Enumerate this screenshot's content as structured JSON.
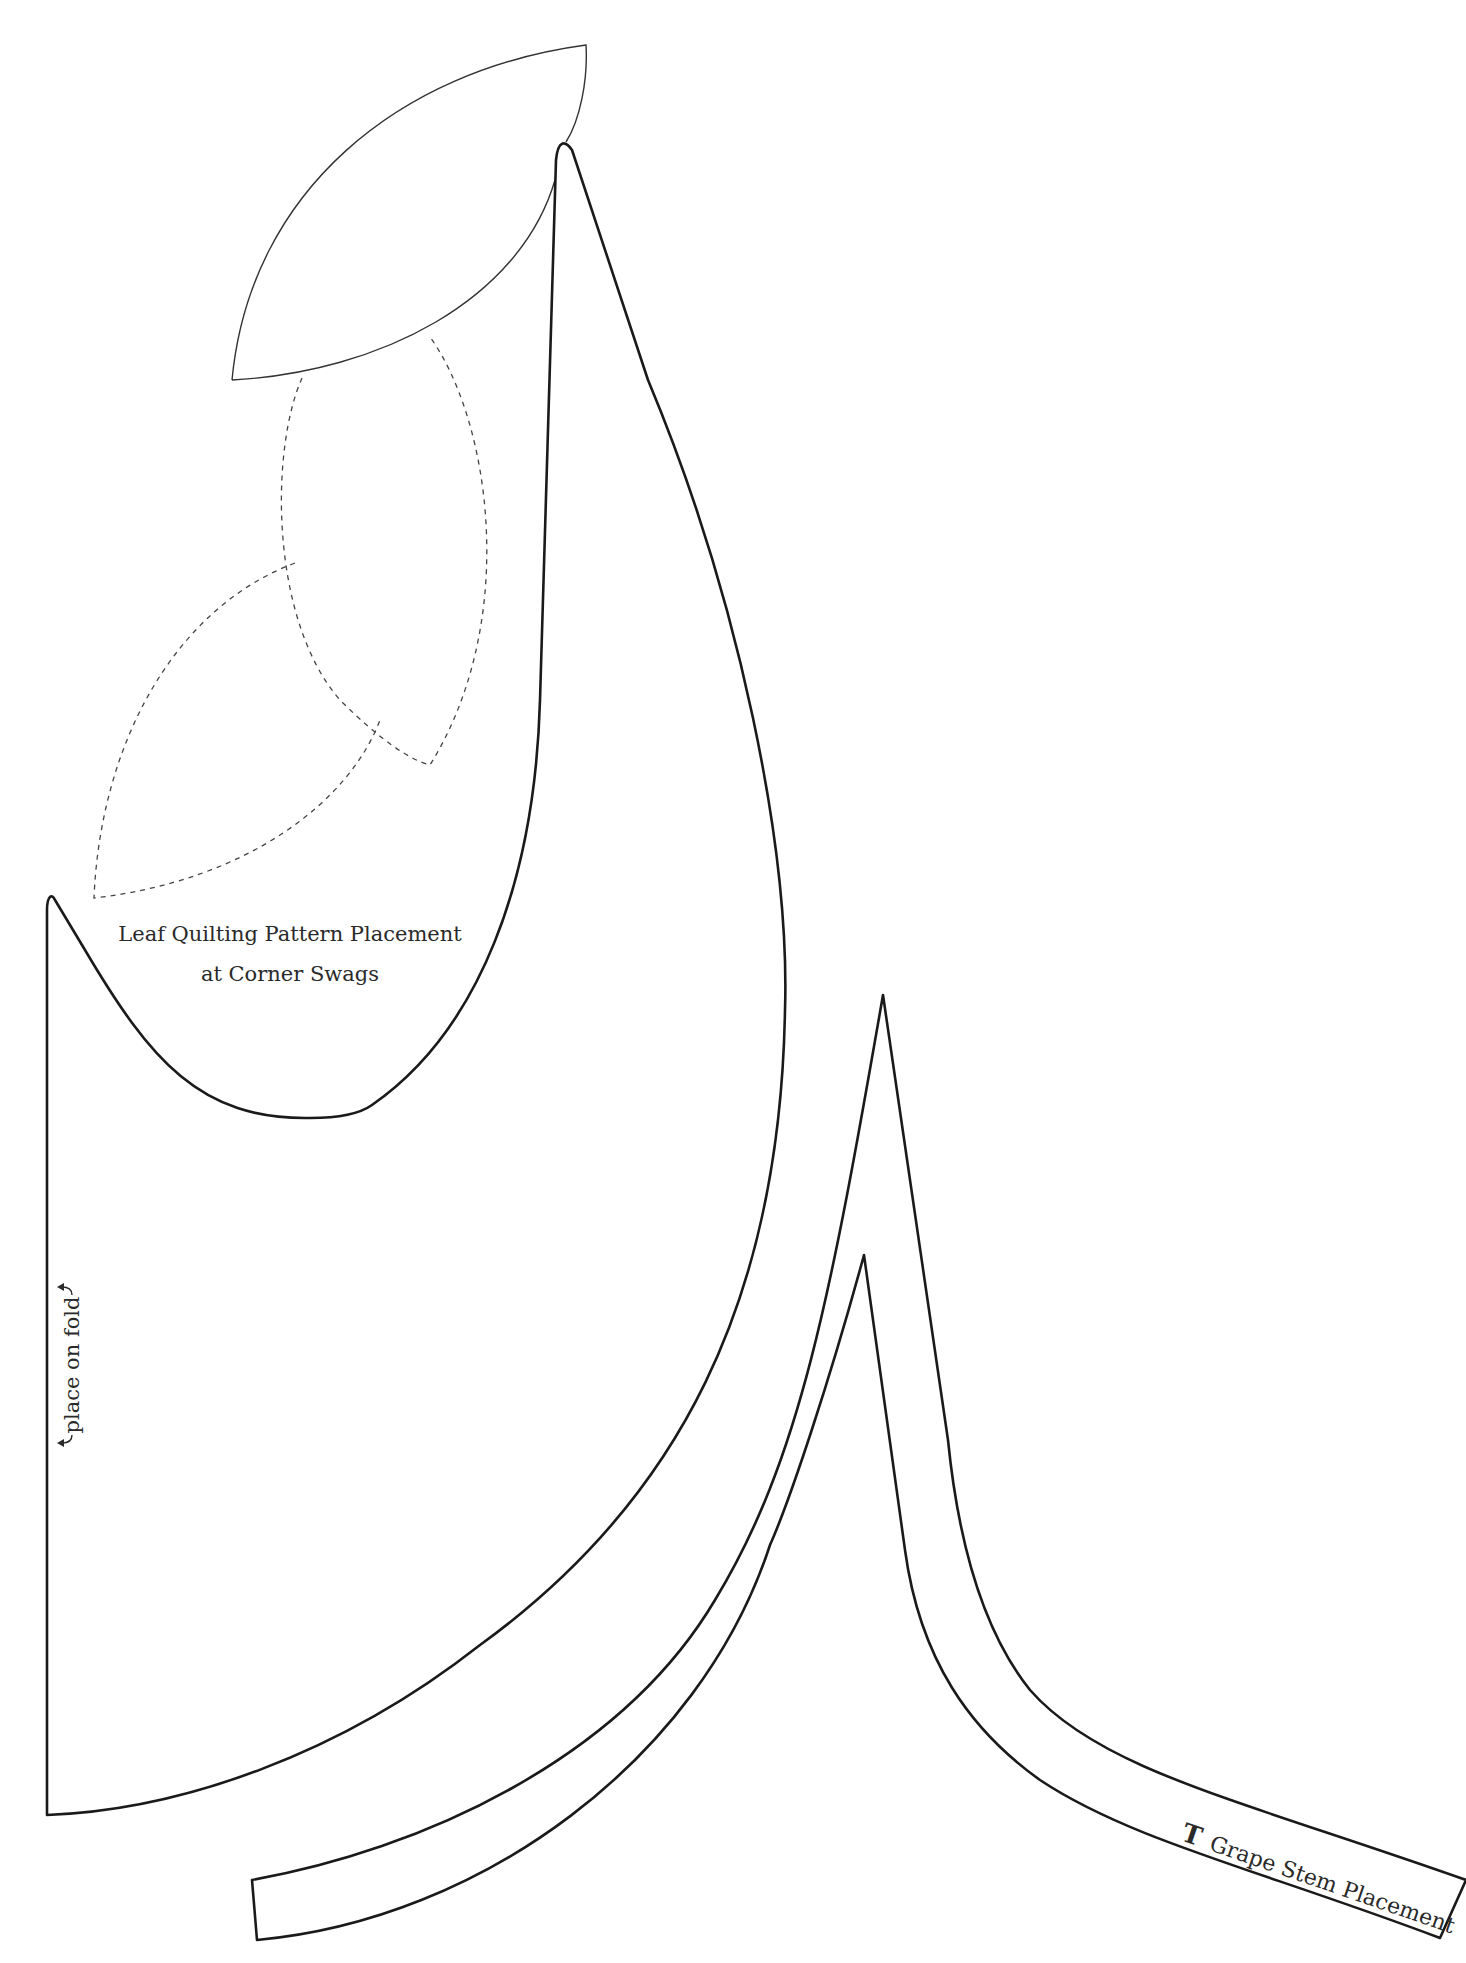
{
  "pattern": {
    "leaf_placement_label_line1": "Leaf Quilting Pattern Placement",
    "leaf_placement_label_line2": "at Corner Swags",
    "fold_label": "place on fold",
    "stem_marker": "T",
    "stem_label": "Grape Stem Placement"
  },
  "colors": {
    "background": "#ffffff",
    "outline": "#1a1a1a",
    "text": "#2a2a2a"
  },
  "icons": {
    "fold_arrows": "double-headed-curved-arrow"
  }
}
